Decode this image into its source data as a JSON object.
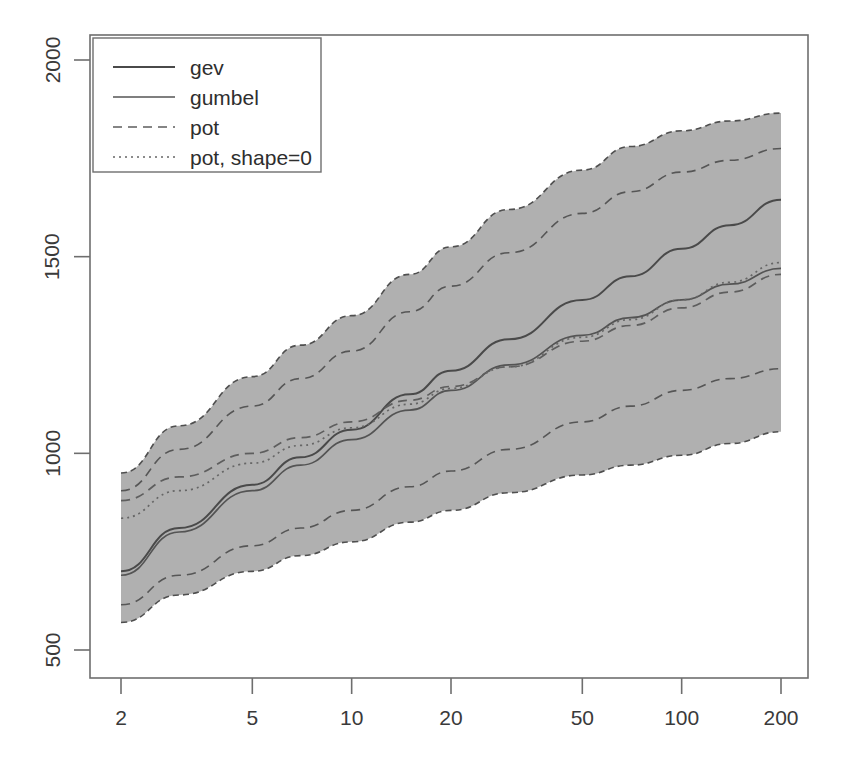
{
  "chart_data": {
    "type": "line",
    "title": "",
    "xlabel": "",
    "ylabel": "",
    "xscale": "log",
    "yscale": "linear",
    "xlim": [
      1.85,
      215
    ],
    "ylim": [
      430,
      2060
    ],
    "xticks": [
      2,
      5,
      10,
      20,
      50,
      100,
      200
    ],
    "xticklabels": [
      "2",
      "5",
      "10",
      "20",
      "50",
      "100",
      "200"
    ],
    "yticks": [
      500,
      1000,
      1500,
      2000
    ],
    "yticklabels": [
      "500",
      "1000",
      "1500",
      "2000"
    ],
    "grid": false,
    "legend_position": "top-left",
    "x": [
      2,
      3,
      5,
      7,
      10,
      15,
      20,
      30,
      50,
      70,
      100,
      140,
      200
    ],
    "series": [
      {
        "name": "gev",
        "style": "solid",
        "color": "#4a4a4a",
        "width": 2.0,
        "values": [
          700,
          810,
          920,
          990,
          1060,
          1150,
          1210,
          1290,
          1390,
          1450,
          1520,
          1580,
          1645
        ]
      },
      {
        "name": "gumbel",
        "style": "solid",
        "color": "#545454",
        "width": 1.7,
        "values": [
          690,
          800,
          905,
          970,
          1035,
          1110,
          1160,
          1225,
          1300,
          1345,
          1390,
          1430,
          1470
        ]
      },
      {
        "name": "pot",
        "style": "dashed",
        "color": "#5e5e5e",
        "width": 1.7,
        "values": [
          880,
          940,
          1000,
          1040,
          1080,
          1135,
          1170,
          1220,
          1285,
          1325,
          1370,
          1410,
          1455
        ]
      },
      {
        "name": "pot, shape=0",
        "style": "dotted",
        "color": "#666666",
        "width": 1.7,
        "values": [
          835,
          905,
          975,
          1020,
          1065,
          1125,
          1165,
          1220,
          1295,
          1340,
          1390,
          1435,
          1485
        ]
      }
    ],
    "confidence_band": {
      "label": "confidence interval",
      "fill": "#a9a9a9",
      "edge_style": "dashed",
      "upper": [
        950,
        1070,
        1195,
        1275,
        1350,
        1455,
        1525,
        1620,
        1720,
        1780,
        1820,
        1845,
        1865
      ],
      "lower": [
        570,
        640,
        700,
        740,
        775,
        825,
        855,
        900,
        945,
        970,
        995,
        1025,
        1055
      ]
    },
    "inner_bands": [
      {
        "name": "gev-interval-upper",
        "style": "dashed",
        "values": [
          905,
          1010,
          1120,
          1190,
          1260,
          1360,
          1425,
          1510,
          1610,
          1665,
          1715,
          1745,
          1775
        ]
      },
      {
        "name": "gev-interval-lower",
        "style": "dashed",
        "values": [
          615,
          690,
          765,
          810,
          855,
          915,
          955,
          1010,
          1080,
          1120,
          1160,
          1190,
          1215
        ]
      }
    ]
  },
  "legend": {
    "entries": [
      {
        "label": "gev"
      },
      {
        "label": "gumbel"
      },
      {
        "label": "pot"
      },
      {
        "label": "pot, shape=0"
      }
    ]
  },
  "axes": {
    "x_labels": [
      "2",
      "5",
      "10",
      "20",
      "50",
      "100",
      "200"
    ],
    "y_labels": [
      "500",
      "1000",
      "1500",
      "2000"
    ]
  }
}
